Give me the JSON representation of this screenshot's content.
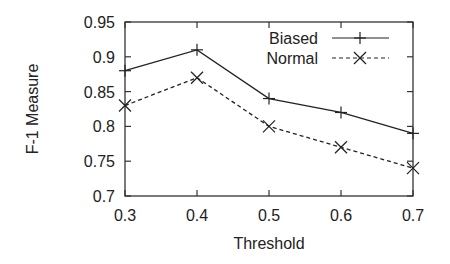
{
  "chart_data": {
    "type": "line",
    "title": "",
    "xlabel": "Threshold",
    "ylabel": "F-1 Measure",
    "x": [
      0.3,
      0.4,
      0.5,
      0.6,
      0.7
    ],
    "x_tick_labels": [
      "0.3",
      "0.4",
      "0.5",
      "0.6",
      "0.7"
    ],
    "y_tick_labels": [
      "0.7",
      "0.75",
      "0.8",
      "0.85",
      "0.9",
      "0.95"
    ],
    "y_ticks": [
      0.7,
      0.75,
      0.8,
      0.85,
      0.9,
      0.95
    ],
    "xlim": [
      0.3,
      0.7
    ],
    "ylim": [
      0.7,
      0.95
    ],
    "grid": false,
    "legend_position": "top-right (inside)",
    "series": [
      {
        "name": "Biased",
        "values": [
          0.88,
          0.91,
          0.84,
          0.82,
          0.79
        ],
        "line_style": "solid",
        "marker": "plus",
        "color": "#222222"
      },
      {
        "name": "Normal",
        "values": [
          0.83,
          0.87,
          0.8,
          0.77,
          0.74
        ],
        "line_style": "dashed",
        "marker": "x",
        "color": "#222222"
      }
    ]
  },
  "plot_area": {
    "left": 125,
    "top": 22,
    "right": 413,
    "bottom": 196
  }
}
